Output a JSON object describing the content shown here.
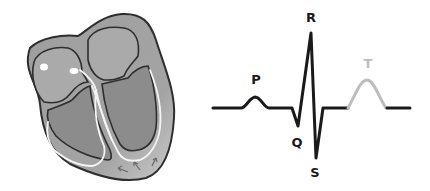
{
  "figure": {
    "left_panel": "heart-cross-section",
    "right_panel": "ecg-waveform"
  },
  "ecg": {
    "labels": {
      "p": "P",
      "q": "Q",
      "r": "R",
      "s": "S",
      "t": "T"
    },
    "colors": {
      "trace": "#1a1a1a",
      "t_wave": "#bdbdbd"
    }
  },
  "heart": {
    "colors": {
      "outer_wall": "#9a9a9a",
      "atria": "#a6a6a6",
      "ventricles": "#8d8d8d",
      "outline": "#333333",
      "conduction": "#f4f4f4"
    }
  }
}
